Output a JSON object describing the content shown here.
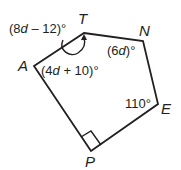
{
  "figure": {
    "type": "pentagon",
    "stroke_color": "#231f20",
    "background": "#ffffff",
    "vertices": [
      {
        "name": "T",
        "x": 84,
        "y": 33
      },
      {
        "name": "N",
        "x": 143,
        "y": 41
      },
      {
        "name": "E",
        "x": 158,
        "y": 104
      },
      {
        "name": "P",
        "x": 91,
        "y": 151
      },
      {
        "name": "A",
        "x": 34,
        "y": 66
      }
    ],
    "vertex_labels": {
      "T": "T",
      "N": "N",
      "E": "E",
      "P": "P",
      "A": "A"
    },
    "angle_labels": {
      "T": {
        "open": "(8",
        "var": "d",
        "rest": " – 12)°"
      },
      "N": {
        "open": "(6",
        "var": "d",
        "rest": ")°"
      },
      "A": {
        "open": "(4",
        "var": "d",
        "rest": " + 10)°"
      },
      "E": {
        "text": "110°"
      },
      "P": {
        "marker": "right-angle"
      }
    }
  }
}
